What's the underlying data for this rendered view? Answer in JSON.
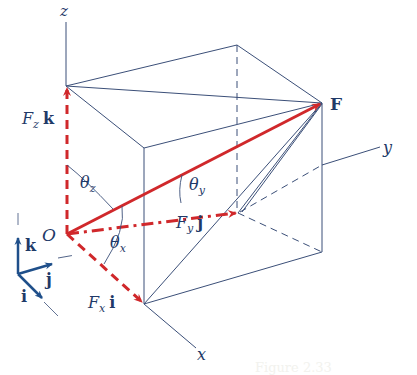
{
  "figure": {
    "colors": {
      "edge": "#3b4f78",
      "vector": "#d0282b",
      "label": "#1f3a68",
      "unit_vector": "#1f4f8a"
    },
    "axes": {
      "x": "x",
      "y": "y",
      "z": "z"
    },
    "origin_label": "O",
    "force_label": "F",
    "components": {
      "fx": {
        "symbol": "F",
        "sub": "x",
        "unit": "i"
      },
      "fy": {
        "symbol": "F",
        "sub": "y",
        "unit": "j"
      },
      "fz": {
        "symbol": "F",
        "sub": "z",
        "unit": "k"
      }
    },
    "angles": {
      "theta_x": {
        "symbol": "θ",
        "sub": "x"
      },
      "theta_y": {
        "symbol": "θ",
        "sub": "y"
      },
      "theta_z": {
        "symbol": "θ",
        "sub": "z"
      }
    },
    "unit_vectors": {
      "i": "i",
      "j": "j",
      "k": "k"
    },
    "caption": "Figure 2.33"
  }
}
